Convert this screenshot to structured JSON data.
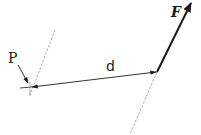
{
  "diagram": {
    "labels": {
      "point": "P",
      "distance": "d",
      "force": "F"
    },
    "colors": {
      "stroke": "#1a1a1a",
      "dashed": "#8a8a8a",
      "background": "#ffffff"
    },
    "elements": [
      {
        "id": "point-p",
        "type": "point",
        "label": "P"
      },
      {
        "id": "distance-d",
        "type": "double-arrow",
        "label": "d"
      },
      {
        "id": "force-f",
        "type": "vector",
        "label": "F"
      },
      {
        "id": "line-of-action",
        "type": "dashed-line"
      },
      {
        "id": "parallel-through-p",
        "type": "dashed-line"
      }
    ]
  }
}
